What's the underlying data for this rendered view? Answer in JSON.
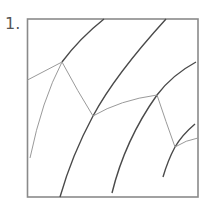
{
  "figure": {
    "number_label": "1.",
    "colors": {
      "frame": "#8a8a8a",
      "dark_curve": "#4a4a4a",
      "thin_line": "#9a9a9a",
      "background": "#ffffff"
    }
  }
}
